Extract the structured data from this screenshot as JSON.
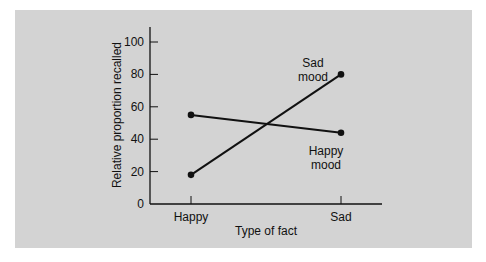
{
  "chart_data": {
    "type": "line",
    "title": "",
    "xlabel": "Type of fact",
    "ylabel": "Relative proportion recalled",
    "categories": [
      "Happy",
      "Sad"
    ],
    "ylim": [
      0,
      100
    ],
    "yticks": [
      0,
      20,
      40,
      60,
      80,
      100
    ],
    "grid": false,
    "legend": "inline annotations",
    "series": [
      {
        "name": "Happy mood",
        "values": [
          55,
          44
        ],
        "annotation": [
          "Happy",
          "mood"
        ]
      },
      {
        "name": "Sad mood",
        "values": [
          18,
          80
        ],
        "annotation": [
          "Sad",
          "mood"
        ]
      }
    ]
  },
  "colors": {
    "background": "#d3d3d3",
    "line": "#111111"
  }
}
